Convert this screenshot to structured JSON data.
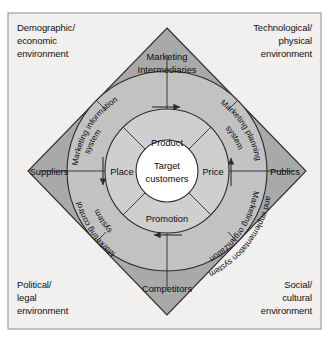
{
  "figure": {
    "kind": "marketing-environment-diagram",
    "background_color": "#ffffff",
    "panel_color": "#f1f0ee",
    "diamond_color": "#a9a9a9",
    "outer_ring_color": "#c2c2c2",
    "inner_ring_color": "#cfcfcf",
    "core_color": "#ffffff",
    "line_color": "#2b2b2b"
  },
  "environments": {
    "top_left": {
      "line1": "Demographic/",
      "line2": "economic",
      "line3": "environment"
    },
    "top_right": {
      "line1": "Technological/",
      "line2": "physical",
      "line3": "environment"
    },
    "bottom_left": {
      "line1": "Political/",
      "line2": "legal",
      "line3": "environment"
    },
    "bottom_right": {
      "line1": "Social/",
      "line2": "cultural",
      "line3": "environment"
    }
  },
  "actors": {
    "top": {
      "line1": "Marketing",
      "line2": "Intermediaries"
    },
    "left": {
      "line1": "Suppliers"
    },
    "right": {
      "line1": "Publics"
    },
    "bottom": {
      "line1": "Competitors"
    }
  },
  "systems": {
    "top_left": {
      "line1": "Marketing information",
      "line2": "system"
    },
    "top_right": {
      "line1": "Marketing planning",
      "line2": "system"
    },
    "bottom_left": {
      "line1": "Marketing control",
      "line2": "system"
    },
    "bottom_right": {
      "line1": "Marketing organization",
      "line2": "and implementation system"
    }
  },
  "marketing_mix": {
    "top": "Product",
    "right": "Price",
    "bottom": "Promotion",
    "left": "Place"
  },
  "core": {
    "line1": "Target",
    "line2": "customers"
  },
  "flow": {
    "direction": "clockwise",
    "arrows": [
      "top-right",
      "right-down",
      "bottom-left",
      "left-up"
    ]
  }
}
